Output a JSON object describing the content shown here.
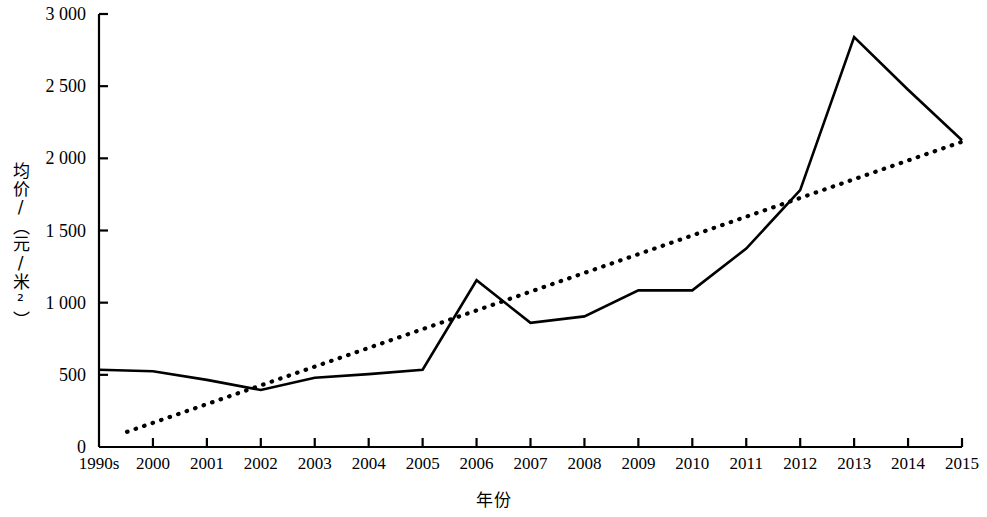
{
  "chart_data": {
    "type": "line",
    "title": "",
    "xlabel": "年份",
    "ylabel": "均价/（元/米²）",
    "categories": [
      "1990s",
      "2000",
      "2001",
      "2002",
      "2003",
      "2004",
      "2005",
      "2006",
      "2007",
      "2008",
      "2009",
      "2010",
      "2011",
      "2012",
      "2013",
      "2014",
      "2015"
    ],
    "ylim": [
      0,
      3000
    ],
    "ytick_labels": [
      "0",
      "500",
      "1 000",
      "1 500",
      "2 000",
      "2 500",
      "3 000"
    ],
    "ytick_values": [
      0,
      500,
      1000,
      1500,
      2000,
      2500,
      3000
    ],
    "grid": false,
    "legend": "none",
    "series": [
      {
        "name": "均价",
        "style": "solid",
        "color": "#000000",
        "values": [
          535,
          525,
          465,
          395,
          480,
          505,
          535,
          1155,
          860,
          905,
          1085,
          1085,
          1375,
          1780,
          2840,
          2475,
          2125
        ]
      },
      {
        "name": "线性趋势线",
        "style": "dotted",
        "color": "#000000",
        "values": [
          105,
          230,
          355,
          480,
          605,
          730,
          855,
          980,
          1105,
          1230,
          1355,
          1480,
          1605,
          1730,
          1855,
          1985,
          2115
        ],
        "endpoints": [
          105,
          2115
        ]
      }
    ]
  },
  "axes": {
    "x_axis_name": "year-axis",
    "y_axis_name": "price-axis"
  }
}
